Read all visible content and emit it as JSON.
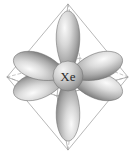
{
  "figure": {
    "name": "xenon-octahedral-hybrid-orbital-diagram",
    "background_color": "#ffffff",
    "width": 135,
    "height": 156
  },
  "atom": {
    "label": "Xe",
    "element_name": "xenon",
    "center_x": 68,
    "center_y": 76,
    "radius": 15,
    "fill_light": "#e8e8e8",
    "fill_dark": "#8d8d8d",
    "label_color": "#2b2b2b"
  },
  "geometry": {
    "shape": "octahedron",
    "hybridization": "sp3d2",
    "lobe_count": 6,
    "vertices": [
      {
        "name": "top",
        "x": 68,
        "y": 4
      },
      {
        "name": "bottom",
        "x": 68,
        "y": 150
      },
      {
        "name": "left",
        "x": 7,
        "y": 77
      },
      {
        "name": "right",
        "x": 128,
        "y": 77
      },
      {
        "name": "front",
        "x": 57,
        "y": 96
      },
      {
        "name": "back",
        "x": 80,
        "y": 58
      }
    ],
    "solid_edge_color": "#9a9a9a",
    "dashed_edge_color": "#adadad",
    "edge_width": 0.7
  },
  "orbitals": [
    {
      "name": "lobe-top",
      "direction": "up",
      "angle_deg": -90,
      "length": 62,
      "width": 24
    },
    {
      "name": "lobe-bottom",
      "direction": "down",
      "angle_deg": 90,
      "length": 62,
      "width": 24
    },
    {
      "name": "lobe-upper-left",
      "direction": "upper-left",
      "angle_deg": 198,
      "length": 58,
      "width": 26
    },
    {
      "name": "lobe-lower-left",
      "direction": "lower-left",
      "angle_deg": 162,
      "length": 58,
      "width": 26
    },
    {
      "name": "lobe-upper-right",
      "direction": "upper-right",
      "angle_deg": -18,
      "length": 58,
      "width": 26
    },
    {
      "name": "lobe-lower-right",
      "direction": "lower-right",
      "angle_deg": 18,
      "length": 58,
      "width": 26
    }
  ],
  "palette": {
    "lobe_highlight": "#f2f2f2",
    "lobe_mid": "#b9b9b9",
    "lobe_shadow": "#6f6f6f",
    "lobe_outline": "#6a6a6a"
  }
}
